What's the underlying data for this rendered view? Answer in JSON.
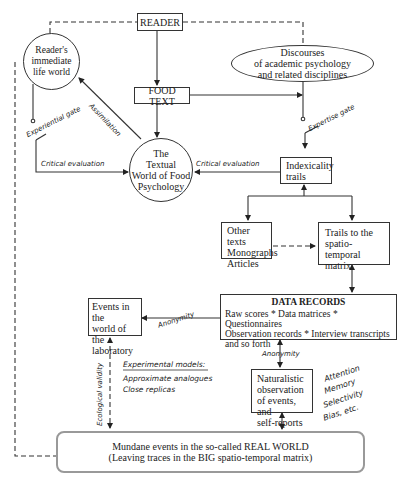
{
  "nodes": {
    "reader": "READER",
    "food_text": "FOOD TEXT",
    "life_world": "Reader's\nimmediate\nlife world",
    "discourses": "Discourses\nof academic psychology\nand related disciplines",
    "textual_world": "The\nTextual\nWorld of Food\nPsychology",
    "indexicality": "Indexicality\ntrails",
    "other_texts": "Other texts\nMonographs\nArticles",
    "trails_matrix": "Trails to the\nspatio-temporal\nmatrix",
    "events_lab": "Events in the\nworld of the\nlaboratory",
    "data_records_title": "DATA RECORDS",
    "data_records_body": "Raw scores * Data matrices * Questionnaires\nObservation records * Interview transcripts\nand so forth",
    "naturalistic": "Naturalistic\nobservation\nof events, and\nself-reports",
    "mundane": "Mundane events in the so-called REAL WORLD\n(Leaving traces in the BIG spatio-temporal matrix)"
  },
  "labels": {
    "assimilation": "Assimilation",
    "experiential_gate": "Experiential gate",
    "expertise_gate": "Expertise gate",
    "critical_eval_left": "Critical evaluation",
    "critical_eval_right": "Critical evaluation",
    "anonymity_left": "Anonymity",
    "anonymity_down": "Anonymity",
    "ecological_validity": "Ecological validity",
    "experimental_models_title": "Experimental models:",
    "experimental_models_items": [
      "Approximate analogues",
      "Close replicas"
    ],
    "biases": [
      "Attention",
      "Memory",
      "Selectivity",
      "Bias, etc."
    ]
  }
}
